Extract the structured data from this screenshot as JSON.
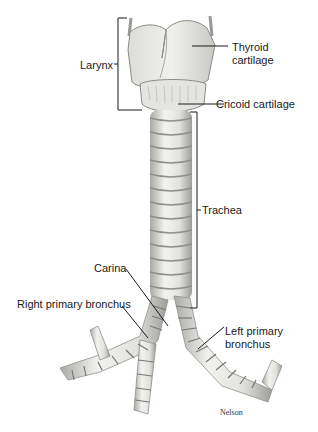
{
  "figure": {
    "signature": "Nelson"
  },
  "labels": {
    "larynx": "Larynx",
    "thyroid_line1": "Thyroid",
    "thyroid_line2": "cartilage",
    "cricoid": "Cricoid cartilage",
    "trachea": "Trachea",
    "carina": "Carina",
    "right_bronchus": "Right primary bronchus",
    "left_bronchus_line1": "Left primary",
    "left_bronchus_line2": "bronchus"
  },
  "colors": {
    "background": "#ffffff",
    "cartilage_fill": "#e9e9e6",
    "cartilage_shade": "#b8b8b4",
    "line": "#1a1a1a"
  }
}
